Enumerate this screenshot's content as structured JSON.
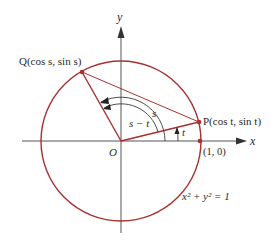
{
  "diagram": {
    "type": "unit-circle",
    "colors": {
      "circle": "#a8312f",
      "axes": "#555555",
      "arcs": "#3a3a3a",
      "text": "#2a2a2a"
    },
    "axes": {
      "x_label": "x",
      "y_label": "y",
      "origin_label": "O"
    },
    "points": {
      "P": {
        "label": "P(cos t, sin t)"
      },
      "Q": {
        "label": "Q(cos s, sin s)"
      },
      "unit": {
        "label": "(1, 0)"
      }
    },
    "angles": {
      "s": "s",
      "s_minus_t": "s − t",
      "t": "t"
    },
    "equation": "x² + y² = 1"
  }
}
